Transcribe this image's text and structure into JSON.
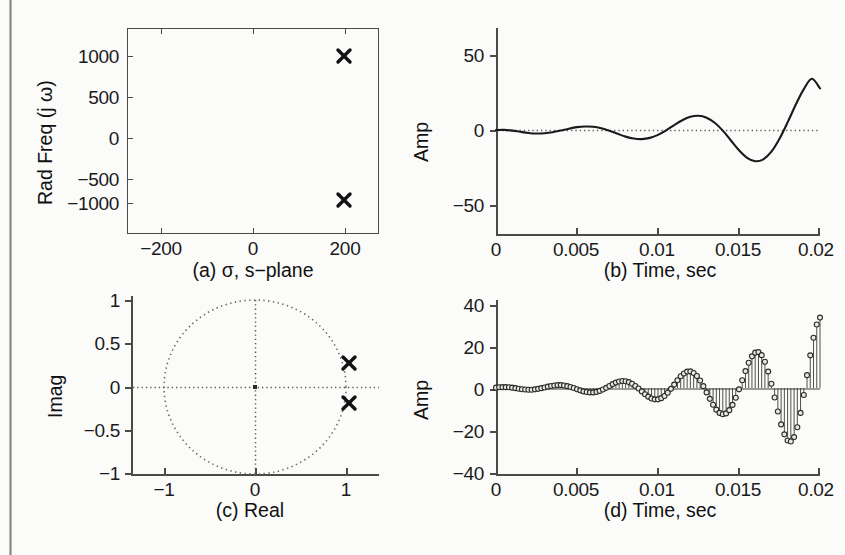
{
  "figure": {
    "background_color": "#fbfbfa",
    "ink_color": "#1a1a1a",
    "panel_count": 4
  },
  "chart_data": [
    {
      "id": "a",
      "type": "scatter",
      "title": "",
      "caption": "(a)   σ, s−plane",
      "xlabel": "σ, s−plane",
      "ylabel": "Rad Freq (j ω)",
      "xlim": [
        -330,
        330
      ],
      "ylim": [
        -1320,
        1320
      ],
      "xticks": [
        -200,
        0,
        200
      ],
      "xticklabels": [
        "−200",
        "0",
        "200"
      ],
      "yticks": [
        -1000,
        -500,
        0,
        500,
        1000
      ],
      "yticklabels": [
        "−1000",
        "−500",
        "0",
        "500",
        "1000"
      ],
      "grid": false,
      "frame": "box",
      "marker": "x",
      "points": [
        {
          "x": 200,
          "y": 1000,
          "label": "pole"
        },
        {
          "x": 200,
          "y": -1000,
          "label": "pole"
        }
      ],
      "legend": null
    },
    {
      "id": "b",
      "type": "line",
      "title": "",
      "caption": "(b) Time, sec",
      "xlabel": "Time, sec",
      "ylabel": "Amp",
      "xlim": [
        0,
        0.02
      ],
      "ylim": [
        -75,
        75
      ],
      "xticks": [
        0,
        0.005,
        0.01,
        0.015,
        0.02
      ],
      "xticklabels": [
        "0",
        "0.005",
        "0.01",
        "0.015",
        "0.02"
      ],
      "yticks": [
        -50,
        0,
        50
      ],
      "yticklabels": [
        "−50",
        "0",
        "50"
      ],
      "grid": false,
      "frame": "left-bottom",
      "zero_reference_line": true,
      "series": [
        {
          "name": "impulse response",
          "description": "growing exponential sinusoid, sigma=200 1/s, omega=1000 rad/s",
          "x": [
            0,
            0.0005,
            0.001,
            0.0015,
            0.002,
            0.0025,
            0.003,
            0.0035,
            0.004,
            0.0045,
            0.005,
            0.0055,
            0.006,
            0.0065,
            0.007,
            0.0075,
            0.008,
            0.0085,
            0.009,
            0.0095,
            0.01,
            0.0105,
            0.011,
            0.0115,
            0.012,
            0.0125,
            0.013,
            0.0135,
            0.014,
            0.0145,
            0.015,
            0.0155,
            0.016,
            0.0165,
            0.017,
            0.0175,
            0.018,
            0.0185,
            0.019,
            0.0195,
            0.02
          ],
          "y": [
            0.7,
            0.8,
            0.3,
            -0.6,
            -1.4,
            -1.8,
            -1.6,
            -0.9,
            0.3,
            1.7,
            2.8,
            3.3,
            3.1,
            2.0,
            0.2,
            -2.0,
            -4.1,
            -5.5,
            -5.9,
            -5.0,
            -2.8,
            0.5,
            4.3,
            7.8,
            10.3,
            11.1,
            9.7,
            6.0,
            0.3,
            -6.9,
            -14.0,
            -19.5,
            -22.0,
            -20.6,
            -15.0,
            -5.6,
            6.3,
            19.1,
            30.5,
            38.0,
            31.0
          ]
        }
      ],
      "legend": null
    },
    {
      "id": "c",
      "type": "scatter",
      "title": "",
      "caption": "(c)  Real",
      "xlabel": "Real",
      "ylabel": "Imag",
      "xlim": [
        -1.32,
        1.32
      ],
      "ylim": [
        -1.22,
        1.22
      ],
      "xticks": [
        -1,
        0,
        1
      ],
      "xticklabels": [
        "−1",
        "0",
        "1"
      ],
      "yticks": [
        -1,
        -0.5,
        0,
        0.5,
        1
      ],
      "yticklabels": [
        "−1",
        "−0.5",
        "0",
        "0.5",
        "1"
      ],
      "grid": false,
      "frame": "left-bottom",
      "unit_circle": true,
      "crosshair_dotted": true,
      "marker": "x",
      "points": [
        {
          "x": 1.02,
          "y": 0.19,
          "label": "pole"
        },
        {
          "x": 1.02,
          "y": -0.21,
          "label": "pole"
        }
      ],
      "legend": null
    },
    {
      "id": "d",
      "type": "line",
      "subtype": "stem",
      "title": "",
      "caption": "(d) Time, sec",
      "xlabel": "Time, sec",
      "ylabel": "Amp",
      "xlim": [
        0,
        0.02
      ],
      "ylim": [
        -52,
        52
      ],
      "xticks": [
        0,
        0.005,
        0.01,
        0.015,
        0.02
      ],
      "xticklabels": [
        "0",
        "0.005",
        "0.01",
        "0.015",
        "0.02"
      ],
      "yticks": [
        -40,
        -20,
        0,
        20,
        40
      ],
      "yticklabels": [
        "−40",
        "−20",
        "0",
        "20",
        "40"
      ],
      "grid": false,
      "frame": "left-bottom",
      "stem_marker": "circle",
      "sample_count": 101,
      "series": [
        {
          "name": "discrete impulse response",
          "description": "sampled growing exponential sinusoid, stem plot",
          "x": [
            0,
            0.0002,
            0.0004,
            0.0006,
            0.0008,
            0.001,
            0.0012,
            0.0014,
            0.0016,
            0.0018,
            0.002,
            0.0022,
            0.0024,
            0.0026,
            0.0028,
            0.003,
            0.0032,
            0.0034,
            0.0036,
            0.0038,
            0.004,
            0.0042,
            0.0044,
            0.0046,
            0.0048,
            0.005,
            0.0052,
            0.0054,
            0.0056,
            0.0058,
            0.006,
            0.0062,
            0.0064,
            0.0066,
            0.0068,
            0.007,
            0.0072,
            0.0074,
            0.0076,
            0.0078,
            0.008,
            0.0082,
            0.0084,
            0.0086,
            0.0088,
            0.009,
            0.0092,
            0.0094,
            0.0096,
            0.0098,
            0.01,
            0.0102,
            0.0104,
            0.0106,
            0.0108,
            0.011,
            0.0112,
            0.0114,
            0.0116,
            0.0118,
            0.012,
            0.0122,
            0.0124,
            0.0126,
            0.0128,
            0.013,
            0.0132,
            0.0134,
            0.0136,
            0.0138,
            0.014,
            0.0142,
            0.0144,
            0.0146,
            0.0148,
            0.015,
            0.0152,
            0.0154,
            0.0156,
            0.0158,
            0.016,
            0.0162,
            0.0164,
            0.0166,
            0.0168,
            0.017,
            0.0172,
            0.0174,
            0.0176,
            0.0178,
            0.018,
            0.0182,
            0.0184,
            0.0186,
            0.0188,
            0.019,
            0.0192,
            0.0194,
            0.0196,
            0.0198,
            0.02
          ],
          "y": [
            0.2,
            0.4,
            0.5,
            0.5,
            0.4,
            0.2,
            -0.1,
            -0.4,
            -0.7,
            -0.9,
            -1.0,
            -1.0,
            -0.8,
            -0.5,
            -0.1,
            0.3,
            0.8,
            1.2,
            1.5,
            1.7,
            1.7,
            1.5,
            1.1,
            0.6,
            0.0,
            -0.7,
            -1.4,
            -2.0,
            -2.4,
            -2.6,
            -2.6,
            -2.3,
            -1.7,
            -0.9,
            0.1,
            1.2,
            2.3,
            3.2,
            3.8,
            4.1,
            4.0,
            3.5,
            2.5,
            1.2,
            -0.3,
            -2.0,
            -3.7,
            -5.1,
            -6.2,
            -6.7,
            -6.7,
            -6.0,
            -4.7,
            -2.8,
            -0.5,
            2.0,
            4.6,
            6.9,
            8.6,
            9.7,
            9.8,
            8.9,
            7.1,
            4.4,
            1.1,
            -2.6,
            -6.4,
            -9.9,
            -12.8,
            -14.7,
            -15.5,
            -15.0,
            -13.1,
            -10.0,
            -5.8,
            -0.8,
            4.6,
            10.0,
            14.9,
            18.7,
            20.9,
            21.2,
            19.4,
            15.5,
            9.7,
            2.5,
            -5.6,
            -13.9,
            -21.5,
            -27.4,
            -31.0,
            -31.6,
            -29.0,
            -23.2,
            -14.7,
            -4.1,
            7.6,
            19.3,
            29.7,
            37.5,
            41.6,
            28.5
          ]
        }
      ],
      "legend": null
    }
  ],
  "panels": {
    "a": {
      "ylabel": "Rad Freq (j ω)",
      "caption": "(a)   σ, s−plane",
      "xticklabels": [
        "−200",
        "0",
        "200"
      ],
      "yticklabels": [
        "1000",
        "500",
        "0",
        "−500",
        "−1000"
      ]
    },
    "b": {
      "ylabel": "Amp",
      "caption": "(b) Time, sec",
      "xticklabels": [
        "0",
        "0.005",
        "0.01",
        "0.015",
        "0.02"
      ],
      "yticklabels": [
        "50",
        "0",
        "−50"
      ]
    },
    "c": {
      "ylabel": "Imag",
      "caption": "(c)  Real",
      "xticklabels": [
        "−1",
        "0",
        "1"
      ],
      "yticklabels": [
        "1",
        "0.5",
        "0",
        "−0.5",
        "−1"
      ]
    },
    "d": {
      "ylabel": "Amp",
      "caption": "(d) Time, sec",
      "xticklabels": [
        "0",
        "0.005",
        "0.01",
        "0.015",
        "0.02"
      ],
      "yticklabels": [
        "40",
        "20",
        "0",
        "−20",
        "−40"
      ]
    }
  }
}
